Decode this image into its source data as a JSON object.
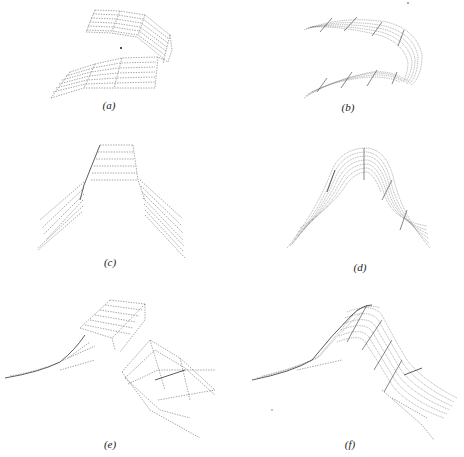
{
  "figure": {
    "panels": [
      {
        "id": "a",
        "label": "(a)",
        "description": "Wireframe surface folded back on itself (two flat sheets joined by a sharp bend)"
      },
      {
        "id": "b",
        "label": "(b)",
        "description": "Densely meshed curved surface forming a U-shaped fold"
      },
      {
        "id": "c",
        "label": "(c)",
        "description": "Wireframe ridge with flat top and straight sloping sides"
      },
      {
        "id": "d",
        "label": "(d)",
        "description": "Densely meshed smooth bell-shaped ridge"
      },
      {
        "id": "e",
        "label": "(e)",
        "description": "Wireframe surface with raised box-like step and sloping flanks"
      },
      {
        "id": "f",
        "label": "(f)",
        "description": "Densely meshed smooth curved hump with sloping flanks"
      }
    ]
  }
}
